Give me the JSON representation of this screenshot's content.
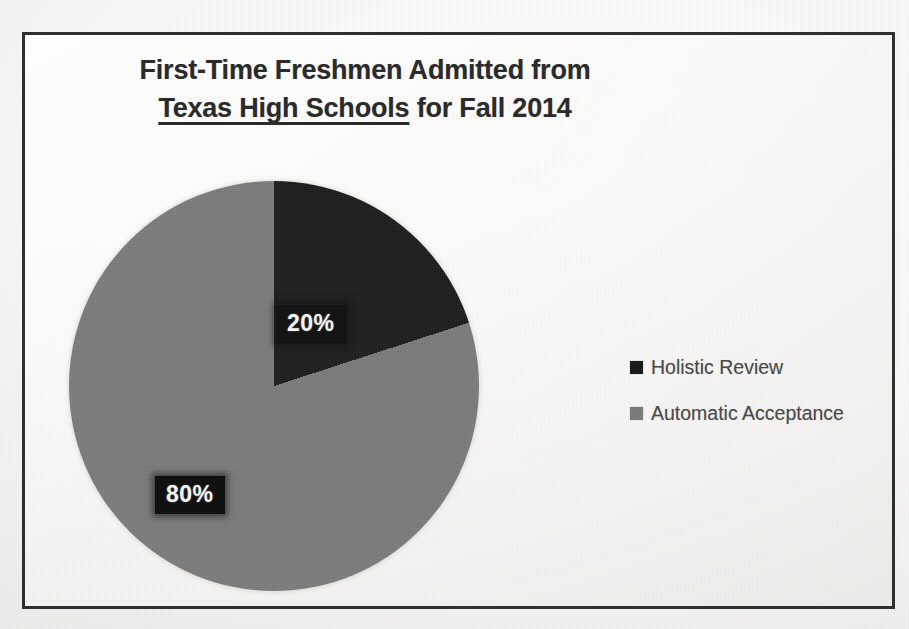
{
  "chart_data": {
    "type": "pie",
    "title": "First-Time Freshmen Admitted from Texas High Schools for Fall 2014",
    "title_lines": [
      {
        "text": "First-Time Freshmen Admitted from",
        "underlined": false
      },
      {
        "text": "Texas High Schools",
        "underlined": true
      },
      {
        "text": " for Fall 2014",
        "underlined": false
      }
    ],
    "categories": [
      "Holistic Review",
      "Automatic Acceptance"
    ],
    "values": [
      20,
      80
    ],
    "value_labels": [
      "20%",
      "80%"
    ],
    "unit": "percent",
    "start_angle_deg": 0,
    "direction": "clockwise",
    "legend_position": "right",
    "grid": false,
    "xlabel": "",
    "ylabel": "",
    "colors": [
      "#1c1c1c",
      "#7b7b7b"
    ]
  },
  "slide": {
    "title": {
      "line1": "First-Time Freshmen Admitted from",
      "line2_underlined": "Texas High Schools",
      "line2_rest": " for Fall 2014"
    },
    "labels": {
      "holistic_value": "20%",
      "automatic_value": "80%"
    },
    "legend": {
      "items": [
        {
          "label": "Holistic Review",
          "color": "#1c1c1c"
        },
        {
          "label": "Automatic Acceptance",
          "color": "#7b7b7b"
        }
      ]
    },
    "theme": {
      "frame_color": "#2f2f2f",
      "page_background": "#f6f5f3",
      "title_color": "#2b2b2b",
      "legend_text_color": "#4a4a4a",
      "label_text_color": "#f4f4f4",
      "label_box_color": "#111111"
    }
  }
}
